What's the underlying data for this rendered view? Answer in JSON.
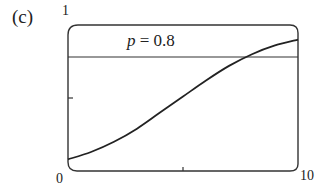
{
  "panel": {
    "label": "(c)"
  },
  "axes": {
    "y_top_label": "1",
    "x_left_label": "0",
    "x_right_label": "10"
  },
  "annotation": {
    "text_italic": "p",
    "text_rest": " = 0.8"
  },
  "chart_data": {
    "type": "line",
    "title": "(c)",
    "xlabel": "",
    "ylabel": "",
    "xlim": [
      0,
      10
    ],
    "ylim": [
      0,
      1
    ],
    "grid": false,
    "legend": null,
    "x_ticks": [
      0,
      5,
      10
    ],
    "y_ticks": [
      0,
      0.5,
      1
    ],
    "tick_labels_shown": {
      "x": [
        "0",
        "10"
      ],
      "y": [
        "1"
      ]
    },
    "series": [
      {
        "name": "curve",
        "x": [
          0,
          1,
          2,
          3,
          4,
          5,
          6,
          7,
          8,
          9,
          10
        ],
        "y": [
          0.08,
          0.13,
          0.2,
          0.29,
          0.4,
          0.51,
          0.62,
          0.72,
          0.8,
          0.86,
          0.9
        ]
      }
    ],
    "reference_lines": [
      {
        "orientation": "horizontal",
        "y": 0.8,
        "label": "p = 0.8"
      }
    ],
    "colors": {
      "line": "#222222",
      "frame": "#333333"
    }
  }
}
